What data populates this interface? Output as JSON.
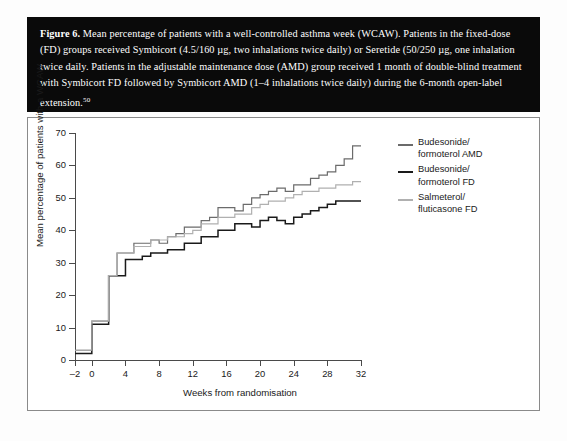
{
  "caption": {
    "figure_label": "Figure 6.",
    "text": " Mean percentage of patients with a well-controlled asthma week (WCAW). Patients in the fixed-dose (FD) groups received Symbicort (4.5/160 µg, two inhalations twice daily) or Seretide (50/250 µg, one inhalation twice daily. Patients in the adjustable maintenance dose (AMD) group received 1 month of double-blind treatment with Symbicort FD followed by Symbicort AMD (1–4 inhalations twice daily) during the 6-month open-label extension.",
    "reference": "50"
  },
  "legend": {
    "items": [
      {
        "line1": "Budesonide/",
        "line2": "formoterol AMD",
        "color": "#6b6b6b",
        "width": 2.0
      },
      {
        "line1": "Budesonide/",
        "line2": "formoterol FD",
        "color": "#1a1a1a",
        "width": 2.2
      },
      {
        "line1": "Salmeterol/",
        "line2": "fluticasone FD",
        "color": "#b0b0b0",
        "width": 2.0
      }
    ]
  },
  "chart_data": {
    "type": "line",
    "title": "",
    "xlabel": "Weeks from randomisation",
    "ylabel": "Mean percentage of patients with a WCAW",
    "xlim": [
      -2,
      32
    ],
    "ylim": [
      0,
      70
    ],
    "xticks": [
      -2,
      0,
      4,
      8,
      12,
      16,
      20,
      24,
      28,
      32
    ],
    "yticks": [
      0,
      10,
      20,
      30,
      40,
      50,
      60,
      70
    ],
    "grid": false,
    "step": true,
    "legend_position": "right",
    "x": [
      -2,
      -1,
      0,
      1,
      2,
      3,
      4,
      5,
      6,
      7,
      8,
      9,
      10,
      11,
      12,
      13,
      14,
      15,
      16,
      17,
      18,
      19,
      20,
      21,
      22,
      23,
      24,
      25,
      26,
      27,
      28,
      29,
      30,
      31,
      32
    ],
    "series": [
      {
        "name": "Budesonide/formoterol AMD",
        "color": "#6b6b6b",
        "values": [
          3,
          3,
          12,
          12,
          26,
          33,
          33,
          36,
          36,
          37,
          36,
          38,
          39,
          41,
          41,
          43,
          44,
          47,
          47,
          46,
          48,
          50,
          51,
          52,
          53,
          52,
          54,
          54,
          56,
          57,
          58,
          60,
          62,
          66,
          66
        ]
      },
      {
        "name": "Budesonide/formoterol FD",
        "color": "#1a1a1a",
        "values": [
          2,
          2,
          11,
          11,
          26,
          26,
          31,
          31,
          32,
          33,
          33,
          34,
          34,
          36,
          36,
          38,
          38,
          40,
          40,
          42,
          42,
          41,
          43,
          44,
          43,
          42,
          44,
          45,
          46,
          47,
          48,
          49,
          49,
          49,
          49
        ]
      },
      {
        "name": "Salmeterol/fluticasone FD",
        "color": "#b0b0b0",
        "values": [
          3,
          3,
          12,
          12,
          26,
          33,
          33,
          35,
          35,
          37,
          37,
          38,
          38,
          39,
          40,
          42,
          42,
          44,
          44,
          45,
          45,
          47,
          48,
          49,
          49,
          50,
          51,
          52,
          52,
          53,
          53,
          54,
          54,
          55,
          55
        ]
      }
    ]
  }
}
